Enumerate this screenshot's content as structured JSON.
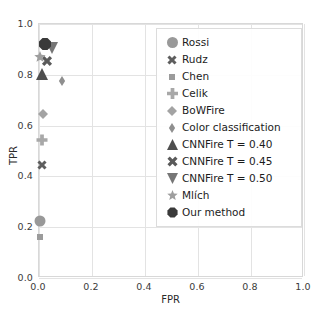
{
  "chart_data": {
    "type": "scatter",
    "title": "",
    "xlabel": "FPR",
    "ylabel": "TPR",
    "xlim": [
      0.0,
      1.0
    ],
    "ylim": [
      0.0,
      1.0
    ],
    "grid": true,
    "legend_position": "upper right",
    "xticks": [
      "0.0",
      "0.2",
      "0.4",
      "0.6",
      "0.8",
      "1.0"
    ],
    "yticks": [
      "0.0",
      "0.2",
      "0.4",
      "0.6",
      "0.8",
      "1.0"
    ],
    "xtick_values": [
      0.0,
      0.2,
      0.4,
      0.6,
      0.8,
      1.0
    ],
    "ytick_values": [
      0.0,
      0.2,
      0.4,
      0.6,
      0.8,
      1.0
    ],
    "series": [
      {
        "name": "Rossi",
        "marker": "circle",
        "color": "#999999",
        "size": 11,
        "x": 0.005,
        "y": 0.225
      },
      {
        "name": "Rudz",
        "marker": "x-thick",
        "color": "#5e5e5e",
        "size": 10,
        "x": 0.012,
        "y": 0.445
      },
      {
        "name": "Chen",
        "marker": "square",
        "color": "#9b9b9b",
        "size": 6,
        "x": 0.004,
        "y": 0.16
      },
      {
        "name": "Celik",
        "marker": "plus-thick",
        "color": "#a8a8a8",
        "size": 11,
        "x": 0.012,
        "y": 0.545
      },
      {
        "name": "BoWFire",
        "marker": "diamond",
        "color": "#a3a3a3",
        "size": 10,
        "x": 0.016,
        "y": 0.645
      },
      {
        "name": "Color classification",
        "marker": "thin-diamond",
        "color": "#8f8f8f",
        "size": 10,
        "x": 0.086,
        "y": 0.775
      },
      {
        "name": "CNNFire T = 0.40",
        "marker": "triangle-up",
        "color": "#4f4f4f",
        "size": 12,
        "x": 0.01,
        "y": 0.805
      },
      {
        "name": "CNNFire T = 0.45",
        "marker": "x-filled",
        "color": "#5a5a5a",
        "size": 11,
        "x": 0.032,
        "y": 0.855
      },
      {
        "name": "CNNFire T = 0.50",
        "marker": "triangle-down",
        "color": "#767676",
        "size": 12,
        "x": 0.048,
        "y": 0.905
      },
      {
        "name": "Mlích",
        "marker": "star",
        "color": "#9e9e9e",
        "size": 12,
        "x": 0.004,
        "y": 0.872
      },
      {
        "name": "Our method",
        "marker": "octagon",
        "color": "#3a3a3a",
        "size": 13,
        "x": 0.024,
        "y": 0.922
      }
    ]
  },
  "legend": {
    "items": [
      {
        "label": "Rossi"
      },
      {
        "label": "Rudz"
      },
      {
        "label": "Chen"
      },
      {
        "label": "Celik"
      },
      {
        "label": "BoWFire"
      },
      {
        "label": "Color classification"
      },
      {
        "label": "CNNFire T = 0.40"
      },
      {
        "label": "CNNFire T = 0.45"
      },
      {
        "label": "CNNFire T = 0.50"
      },
      {
        "label": "Mlích"
      },
      {
        "label": "Our method"
      }
    ]
  },
  "axes": {
    "x_title": "FPR",
    "y_title": "TPR"
  },
  "colors": {
    "grid": "#e3e3e3",
    "frame": "#d8d8d8",
    "text": "#262626",
    "background": "#ffffff"
  }
}
